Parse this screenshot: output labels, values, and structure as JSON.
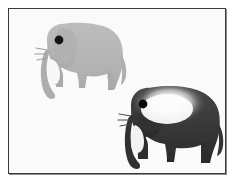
{
  "image": {
    "kind": "scanned-illustration",
    "width": 236,
    "height": 185,
    "background_color": "#ffffff",
    "frame": {
      "name": "picture-frame",
      "border_color": "#3a3a3c",
      "border_width_px": 1,
      "inner_fill": "#fefefe",
      "drop_shadow_color": "#8d8d90",
      "inset_px": 8
    },
    "subjects": [
      {
        "name": "elephant-light",
        "label": "light gray elephant silhouette",
        "position": "upper-left",
        "body_color": "#b9b9b9",
        "body_color_shaded": "#aeaeae",
        "eye_color": "#141414",
        "tusk_color": "#fafafa",
        "facing": "left",
        "shading": "flat",
        "legs": 4
      },
      {
        "name": "elephant-dark",
        "label": "dark gray elephant silhouette with white glow on body",
        "position": "lower-right",
        "body_color": "#3a3a3a",
        "body_color_shaded": "#2c2c2c",
        "eye_color": "#0a0a0a",
        "tusk_color": "#f5f5f5",
        "facing": "left",
        "shading": "radial white highlight",
        "glow_color": "#ffffff",
        "legs": 4
      }
    ]
  }
}
